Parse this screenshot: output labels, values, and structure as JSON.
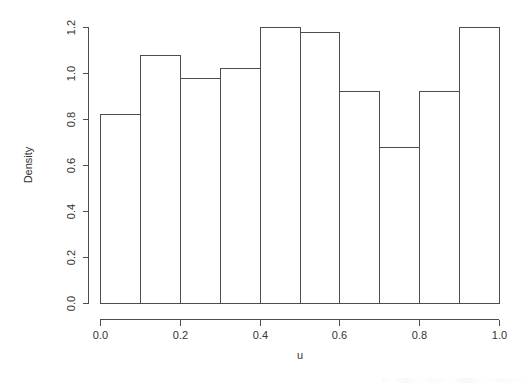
{
  "chart_data": {
    "type": "bar",
    "subtype": "histogram",
    "title": "",
    "xlabel": "u",
    "ylabel": "Density",
    "bin_width": 0.1,
    "bin_edges": [
      0.0,
      0.1,
      0.2,
      0.3,
      0.4,
      0.5,
      0.6,
      0.7,
      0.8,
      0.9,
      1.0
    ],
    "categories": [
      "0.0-0.1",
      "0.1-0.2",
      "0.2-0.3",
      "0.3-0.4",
      "0.4-0.5",
      "0.5-0.6",
      "0.6-0.7",
      "0.7-0.8",
      "0.8-0.9",
      "0.9-1.0"
    ],
    "values": [
      0.82,
      1.08,
      0.98,
      1.02,
      1.2,
      1.18,
      0.92,
      0.68,
      0.92,
      1.2
    ],
    "xlim": [
      0.0,
      1.0
    ],
    "ylim": [
      0.0,
      1.2
    ],
    "xticks": [
      0.0,
      0.2,
      0.4,
      0.6,
      0.8,
      1.0
    ],
    "xtick_labels": [
      "0.0",
      "0.2",
      "0.4",
      "0.6",
      "0.8",
      "1.0"
    ],
    "yticks": [
      0.0,
      0.2,
      0.4,
      0.6,
      0.8,
      1.0,
      1.2
    ],
    "ytick_labels": [
      "0.0",
      "0.2",
      "0.4",
      "0.6",
      "0.8",
      "1.0",
      "1.2"
    ],
    "grid": false,
    "legend": null,
    "legend_position": "none",
    "bar_fill_color": "#ffffff",
    "bar_stroke_color": "#4d4d4d",
    "axis_color": "#4d4d4d",
    "text_color": "#333333",
    "background_color": "#ffffff"
  }
}
